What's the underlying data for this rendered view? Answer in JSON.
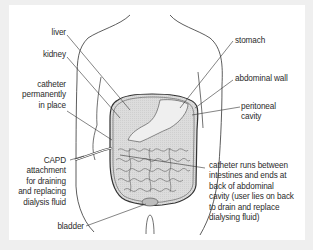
{
  "diagram": {
    "title": "",
    "labels": {
      "liver": "liver",
      "kidney": "kidney",
      "catheter_in_place": [
        "catheter",
        "permanently",
        "in place"
      ],
      "capd": [
        "CAPD",
        "attachment",
        "for draining",
        "and replacing",
        "dialysis fluid"
      ],
      "bladder": "bladder",
      "stomach": "stomach",
      "abdominal_wall": "abdominal wall",
      "peritoneal_cavity": [
        "peritoneal",
        "cavity"
      ],
      "catheter_runs": [
        "catheter runs between",
        "intestines and ends at",
        "back of abdominal",
        "cavity (user lies on back",
        "to drain and replace",
        "dialysing fluid)"
      ]
    },
    "colors": {
      "background": "#efefef",
      "panel": "#ffffff",
      "line": "#3a3a3a",
      "cavity_fill": "#d9d9d9",
      "organ_fill": "#e8e8e8",
      "text": "#2b2b2b"
    }
  }
}
